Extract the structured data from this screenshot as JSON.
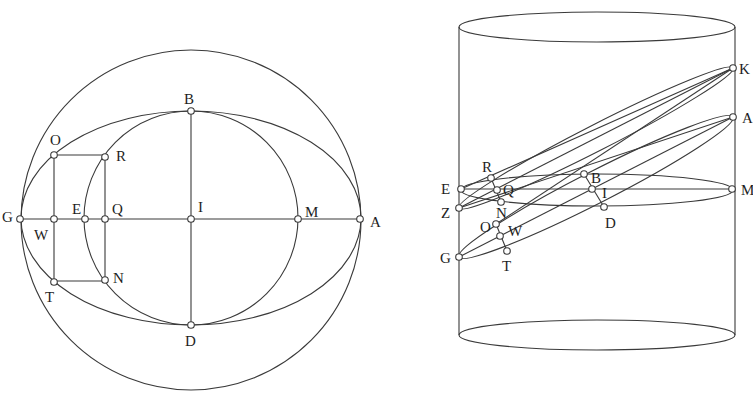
{
  "figures": {
    "left": {
      "title": "Planar construction: circle, ellipse and auxiliary circle",
      "labels": {
        "B": "B",
        "O": "O",
        "R": "R",
        "G": "G",
        "W": "W",
        "E": "E",
        "Q": "Q",
        "I": "I",
        "M": "M",
        "A": "A",
        "T": "T",
        "N": "N",
        "D": "D"
      }
    },
    "right": {
      "title": "Cylinder with oblique sections",
      "labels": {
        "K": "K",
        "A": "A",
        "M": "M",
        "E": "E",
        "Z": "Z",
        "G": "G",
        "R": "R",
        "Q": "Q",
        "N": "N",
        "O": "O",
        "W": "W",
        "T": "T",
        "B": "B",
        "I": "I",
        "D": "D"
      }
    }
  },
  "colors": {
    "stroke": "#3a3a3a",
    "text": "#1e1e1e",
    "background": "#ffffff"
  }
}
